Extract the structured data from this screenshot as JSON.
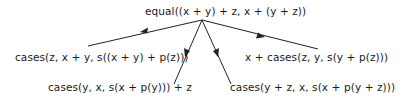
{
  "diagram": {
    "type": "tree",
    "root": {
      "label": "equal((x + y) + z, x + (y + z))"
    },
    "children": [
      {
        "id": "c1",
        "label": "cases(z, x + y, s((x + y) + p(z)))"
      },
      {
        "id": "c2",
        "label": "cases(y, x, s(x + p(y))) + z"
      },
      {
        "id": "c3",
        "label": "cases(y + z, x, s(x + p(y + z)))"
      },
      {
        "id": "c4",
        "label": "x + cases(z, y, s(y + p(z)))"
      }
    ],
    "edges": [
      {
        "from": "root",
        "to": "c1",
        "arrow": true
      },
      {
        "from": "root",
        "to": "c2",
        "arrow": true
      },
      {
        "from": "root",
        "to": "c3",
        "arrow": true
      },
      {
        "from": "root",
        "to": "c4",
        "arrow": true
      }
    ],
    "colors": {
      "line": "#222222",
      "text": "#1a1a1a",
      "background": "#ffffff"
    }
  }
}
